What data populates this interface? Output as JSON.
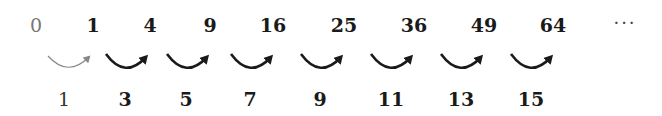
{
  "squares": [
    {
      "label": "0",
      "x": 36
    },
    {
      "label": "1",
      "x": 93
    },
    {
      "label": "4",
      "x": 150
    },
    {
      "label": "9",
      "x": 210
    },
    {
      "label": "16",
      "x": 273
    },
    {
      "label": "25",
      "x": 344
    },
    {
      "label": "36",
      "x": 414
    },
    {
      "label": "49",
      "x": 484
    },
    {
      "label": "64",
      "x": 553
    }
  ],
  "ellipsis": "···",
  "differences": [
    {
      "label": "1",
      "x": 64
    },
    {
      "label": "3",
      "x": 125
    },
    {
      "label": "5",
      "x": 186
    },
    {
      "label": "7",
      "x": 250
    },
    {
      "label": "9",
      "x": 320
    },
    {
      "label": "11",
      "x": 391
    },
    {
      "label": "13",
      "x": 461
    },
    {
      "label": "15",
      "x": 531
    }
  ],
  "colors": {
    "primary": "#1a1a1a",
    "first_step": "#888888"
  }
}
